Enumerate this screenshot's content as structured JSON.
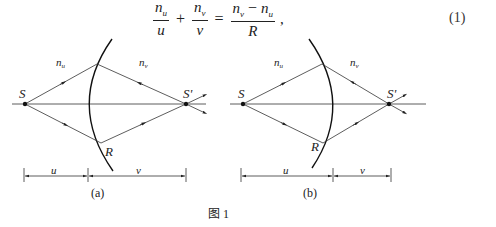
{
  "equation": {
    "term1": {
      "numerator": "n",
      "numerator_sub": "u",
      "denominator": "u"
    },
    "op1": "+",
    "term2": {
      "numerator": "n",
      "numerator_sub": "v",
      "denominator": "v"
    },
    "op2": "=",
    "term3": {
      "numerator_a": "n",
      "numerator_a_sub": "v",
      "minus": "−",
      "numerator_b": "n",
      "numerator_b_sub": "u",
      "denominator": "R"
    },
    "trailing": ",",
    "number": "(1)"
  },
  "figure": {
    "caption": "图 1",
    "panels": [
      {
        "id": "a",
        "label": "(a)",
        "source_label": "S",
        "image_label": "S'",
        "point_label": "R",
        "medium_left": "n",
        "medium_left_sub": "u",
        "medium_right": "n",
        "medium_right_sub": "v",
        "dim_left": "u",
        "dim_right": "v"
      },
      {
        "id": "b",
        "label": "(b)",
        "source_label": "S",
        "image_label": "S'",
        "point_label": "R",
        "medium_left": "n",
        "medium_left_sub": "u",
        "medium_right": "n",
        "medium_right_sub": "v",
        "dim_left": "u",
        "dim_right": "v"
      }
    ]
  },
  "colors": {
    "ink": "#222222",
    "background": "#ffffff"
  }
}
